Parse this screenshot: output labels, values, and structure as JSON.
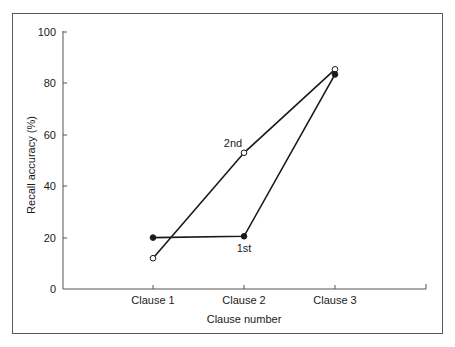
{
  "chart_data": {
    "type": "line",
    "title": "",
    "xlabel": "Clause number",
    "ylabel": "Recall accuracy (%)",
    "categories": [
      "Clause 1",
      "Clause 2",
      "Clause 3"
    ],
    "ylim": [
      0,
      100
    ],
    "yticks": [
      0,
      20,
      40,
      60,
      80,
      100
    ],
    "grid": false,
    "legend": "none (inline labels)",
    "series": [
      {
        "name": "1st",
        "marker": "filled-circle",
        "values": [
          20,
          20.5,
          83.5
        ]
      },
      {
        "name": "2nd",
        "marker": "open-circle",
        "values": [
          12,
          53,
          85.5
        ]
      }
    ],
    "annotations": [
      {
        "text": "1st",
        "near": "Clause 2, series 1st"
      },
      {
        "text": "2nd",
        "near": "Clause 2, series 2nd"
      }
    ]
  },
  "labels": {
    "ytick": [
      "0",
      "20",
      "40",
      "60",
      "80",
      "100"
    ],
    "xtick": [
      "Clause 1",
      "Clause 2",
      "Clause 3"
    ],
    "xlabel": "Clause number",
    "ylabel": "Recall accuracy (%)",
    "series1": "1st",
    "series2": "2nd"
  },
  "colors": {
    "line": "#1a1a1a",
    "axis": "#555555",
    "frame": "#555555"
  }
}
